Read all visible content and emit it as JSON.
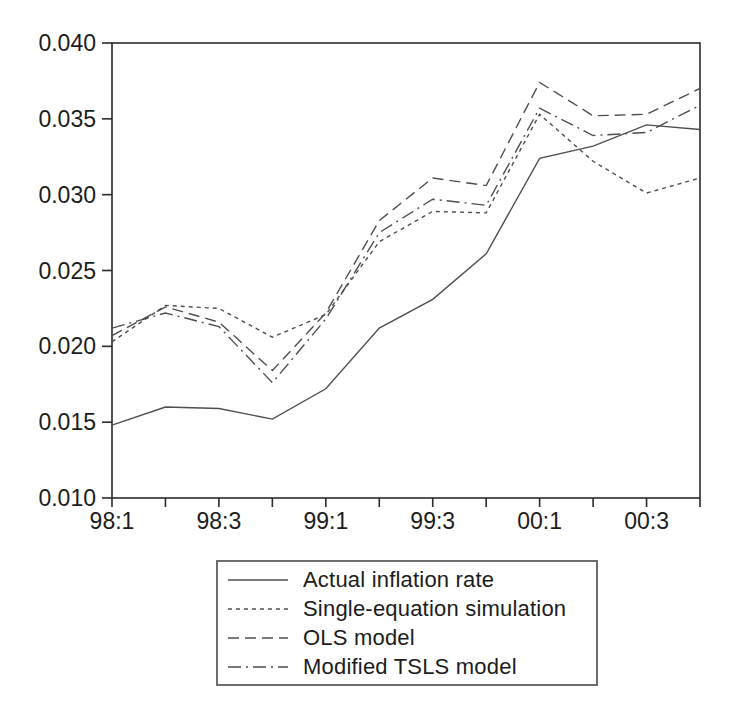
{
  "figure": {
    "background_color": "#ffffff"
  },
  "chart_data": {
    "type": "line",
    "title": "",
    "xlabel": "",
    "ylabel": "",
    "grid": false,
    "legend_position": "below",
    "ylim": [
      0.01,
      0.04
    ],
    "y_ticks": [
      {
        "value": 0.01,
        "label": "0.010"
      },
      {
        "value": 0.015,
        "label": "0.015"
      },
      {
        "value": 0.02,
        "label": "0.020"
      },
      {
        "value": 0.025,
        "label": "0.025"
      },
      {
        "value": 0.03,
        "label": "0.030"
      },
      {
        "value": 0.035,
        "label": "0.035"
      },
      {
        "value": 0.04,
        "label": "0.040"
      }
    ],
    "x_ticks": [
      {
        "category": "98:1",
        "label": "98:1"
      },
      {
        "category": "98:2",
        "label": ""
      },
      {
        "category": "98:3",
        "label": "98:3"
      },
      {
        "category": "98:4",
        "label": ""
      },
      {
        "category": "99:1",
        "label": "99:1"
      },
      {
        "category": "99:2",
        "label": ""
      },
      {
        "category": "99:3",
        "label": "99:3"
      },
      {
        "category": "99:4",
        "label": ""
      },
      {
        "category": "00:1",
        "label": "00:1"
      },
      {
        "category": "00:2",
        "label": ""
      },
      {
        "category": "00:3",
        "label": "00:3"
      },
      {
        "category": "00:4",
        "label": ""
      }
    ],
    "series": [
      {
        "name": "Actual inflation rate",
        "line_style": "solid",
        "values": [
          0.0148,
          0.016,
          0.0159,
          0.0152,
          0.0172,
          0.0212,
          0.0231,
          0.0261,
          0.0324,
          0.0332,
          0.0346,
          0.0343
        ]
      },
      {
        "name": "Single-equation simulation",
        "line_style": "short-dash",
        "values": [
          0.0203,
          0.0227,
          0.0225,
          0.0206,
          0.0221,
          0.0269,
          0.0289,
          0.0288,
          0.0353,
          0.0322,
          0.0301,
          0.0311
        ]
      },
      {
        "name": "OLS model",
        "line_style": "long-dash",
        "values": [
          0.0207,
          0.0226,
          0.0216,
          0.0184,
          0.0222,
          0.0283,
          0.0311,
          0.0306,
          0.0374,
          0.0352,
          0.0353,
          0.037
        ]
      },
      {
        "name": "Modified TSLS model",
        "line_style": "dash-dot",
        "values": [
          0.0212,
          0.0222,
          0.0213,
          0.0176,
          0.0218,
          0.0275,
          0.0297,
          0.0293,
          0.0357,
          0.0339,
          0.0341,
          0.0359
        ]
      }
    ],
    "line_color": "#4f4f4f",
    "axis_color": "#2b2b2b",
    "text_color": "#1c1c1c"
  }
}
